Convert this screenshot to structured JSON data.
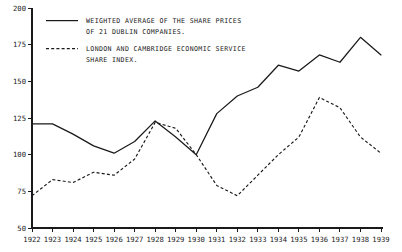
{
  "chart_data": {
    "type": "line",
    "title": "",
    "xlabel": "",
    "ylabel": "",
    "grid": false,
    "legend_position": "top-left-inside",
    "xlim": [
      1922,
      1939
    ],
    "ylim": [
      50,
      200
    ],
    "yticks": [
      50,
      75,
      100,
      125,
      150,
      175,
      200
    ],
    "ytick_labels": [
      "50",
      "75",
      "100",
      "125",
      "150",
      "175",
      "200"
    ],
    "categories": [
      1922,
      1923,
      1924,
      1925,
      1926,
      1927,
      1928,
      1929,
      1930,
      1931,
      1932,
      1933,
      1934,
      1935,
      1936,
      1937,
      1938,
      1939
    ],
    "xtick_labels": [
      "1922",
      "1923",
      "1924",
      "1925",
      "1926",
      "1927",
      "1928",
      "1929",
      "1930",
      "1931",
      "1932",
      "1933",
      "1934",
      "1935",
      "1936",
      "1937",
      "1938",
      "1939"
    ],
    "series": [
      {
        "name": "WEIGHTED AVERAGE OF THE SHARE PRICES OF 21 DUBLIN COMPANIES.",
        "style": "solid",
        "color": "#1a1a1a",
        "values": [
          121,
          121,
          114,
          106,
          101,
          109,
          123,
          112,
          100,
          128,
          140,
          146,
          161,
          157,
          168,
          163,
          180,
          168
        ]
      },
      {
        "name": "LONDON AND CAMBRIDGE ECONOMIC SERVICE SHARE INDEX.",
        "style": "dashed",
        "color": "#1a1a1a",
        "values": [
          72,
          83,
          81,
          88,
          86,
          97,
          122,
          118,
          100,
          79,
          72,
          86,
          100,
          112,
          139,
          132,
          112,
          101
        ]
      }
    ],
    "legend": [
      {
        "style": "solid",
        "lines": [
          "WEIGHTED AVERAGE OF THE SHARE PRICES",
          "OF 21 DUBLIN COMPANIES."
        ]
      },
      {
        "style": "dashed",
        "lines": [
          "LONDON AND CAMBRIDGE ECONOMIC SERVICE",
          "SHARE INDEX."
        ]
      }
    ]
  }
}
